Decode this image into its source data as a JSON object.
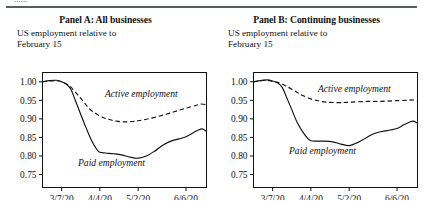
{
  "figure": {
    "clipped_header_text": "......",
    "panels": [
      {
        "id": "panel-a",
        "title": "Panel A: All businesses",
        "subtitle": "US employment relative to\nFebruary 15",
        "series_labels": {
          "active": "Active employment",
          "paid": "Paid employment"
        }
      },
      {
        "id": "panel-b",
        "title": "Panel B: Continuing businesses",
        "subtitle": "US employment relative to\nFebruary 15",
        "series_labels": {
          "active": "Active employment",
          "paid": "Paid employment"
        }
      }
    ]
  },
  "chart_data": [
    {
      "type": "line",
      "title": "Panel A: All businesses",
      "subtitle": "US employment relative to February 15",
      "xlabel": "",
      "ylabel": "",
      "xticklabels": [
        "3/7/20",
        "4/4/20",
        "5/2/20",
        "6/6/20"
      ],
      "xtickvalues": [
        14,
        42,
        70,
        105
      ],
      "yticklabels": [
        "0.75",
        "0.80",
        "0.85",
        "0.90",
        "0.95",
        "1.00"
      ],
      "ytickvalues": [
        0.75,
        0.8,
        0.85,
        0.9,
        0.95,
        1.0
      ],
      "xlim": [
        0,
        120
      ],
      "ylim": [
        0.715,
        1.025
      ],
      "grid": false,
      "legend": "inline-annotations",
      "x_note": "days since Feb 22 2020; tick 14=3/7/20, 42=4/4/20, 70=5/2/20, 105=6/6/20",
      "series": [
        {
          "name": "Active employment",
          "style": "dashed",
          "color": "#111111",
          "x": [
            0,
            5,
            10,
            14,
            18,
            21,
            24,
            28,
            32,
            36,
            42,
            48,
            54,
            60,
            66,
            70,
            76,
            84,
            91,
            98,
            105,
            112,
            116,
            120
          ],
          "values": [
            1.0,
            1.002,
            1.003,
            1.0,
            0.993,
            0.985,
            0.972,
            0.955,
            0.937,
            0.922,
            0.908,
            0.899,
            0.894,
            0.892,
            0.893,
            0.895,
            0.899,
            0.906,
            0.913,
            0.921,
            0.929,
            0.936,
            0.94,
            0.938
          ]
        },
        {
          "name": "Paid employment",
          "style": "solid",
          "color": "#111111",
          "x": [
            0,
            5,
            10,
            14,
            18,
            21,
            24,
            28,
            32,
            36,
            40,
            42,
            46,
            52,
            58,
            64,
            70,
            76,
            82,
            88,
            94,
            100,
            105,
            110,
            114,
            117,
            120
          ],
          "values": [
            1.0,
            1.003,
            1.004,
            1.0,
            0.992,
            0.978,
            0.95,
            0.912,
            0.875,
            0.841,
            0.816,
            0.81,
            0.808,
            0.806,
            0.803,
            0.797,
            0.794,
            0.8,
            0.813,
            0.829,
            0.84,
            0.846,
            0.852,
            0.862,
            0.87,
            0.873,
            0.866
          ]
        }
      ]
    },
    {
      "type": "line",
      "title": "Panel B: Continuing businesses",
      "subtitle": "US employment relative to February 15",
      "xlabel": "",
      "ylabel": "",
      "xticklabels": [
        "3/7/20",
        "4/4/20",
        "5/2/20",
        "6/6/20"
      ],
      "xtickvalues": [
        14,
        42,
        70,
        105
      ],
      "yticklabels": [
        "0.75",
        "0.80",
        "0.85",
        "0.90",
        "0.95",
        "1.00"
      ],
      "ytickvalues": [
        0.75,
        0.8,
        0.85,
        0.9,
        0.95,
        1.0
      ],
      "xlim": [
        0,
        120
      ],
      "ylim": [
        0.715,
        1.025
      ],
      "grid": false,
      "legend": "inline-annotations",
      "x_note": "days since Feb 22 2020; tick 14=3/7/20, 42=4/4/20, 70=5/2/20, 105=6/6/20",
      "series": [
        {
          "name": "Active employment",
          "style": "dashed",
          "color": "#111111",
          "x": [
            0,
            5,
            10,
            14,
            18,
            21,
            24,
            28,
            32,
            36,
            42,
            48,
            54,
            60,
            66,
            70,
            76,
            84,
            91,
            98,
            105,
            112,
            116,
            120
          ],
          "values": [
            1.0,
            1.003,
            1.004,
            1.001,
            0.998,
            0.994,
            0.988,
            0.98,
            0.971,
            0.963,
            0.954,
            0.948,
            0.945,
            0.944,
            0.944,
            0.945,
            0.946,
            0.947,
            0.947,
            0.948,
            0.949,
            0.95,
            0.951,
            0.949
          ]
        },
        {
          "name": "Paid employment",
          "style": "solid",
          "color": "#111111",
          "x": [
            0,
            5,
            10,
            14,
            18,
            21,
            24,
            28,
            32,
            36,
            40,
            42,
            46,
            52,
            58,
            64,
            70,
            76,
            82,
            88,
            94,
            100,
            105,
            110,
            114,
            117,
            120
          ],
          "values": [
            1.0,
            1.003,
            1.005,
            1.002,
            0.996,
            0.985,
            0.96,
            0.925,
            0.89,
            0.865,
            0.846,
            0.841,
            0.84,
            0.84,
            0.838,
            0.832,
            0.828,
            0.836,
            0.848,
            0.86,
            0.866,
            0.87,
            0.874,
            0.884,
            0.891,
            0.894,
            0.888
          ]
        }
      ]
    }
  ]
}
